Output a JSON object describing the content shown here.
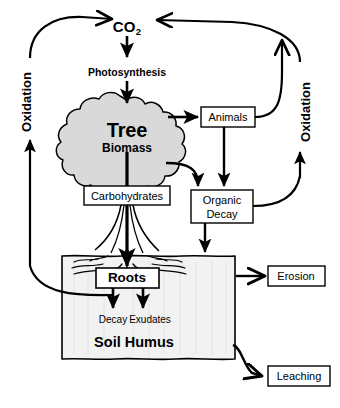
{
  "diagram": {
    "background_color": "#ffffff",
    "line_color": "#000000",
    "canopy_fill": "#d9d9d9",
    "soil_fill": "#f2f2f2",
    "nodes": {
      "co2": {
        "label": "CO",
        "subscript": "2"
      },
      "photosynthesis": {
        "label": "Photosynthesis"
      },
      "tree_biomass": {
        "line1": "Tree",
        "line2": "Biomass"
      },
      "carbohydrates": {
        "label": "Carbohydrates"
      },
      "animals": {
        "label": "Animals"
      },
      "organic_decay": {
        "line1": "Organic",
        "line2": "Decay"
      },
      "roots": {
        "label": "Roots"
      },
      "decay": {
        "label": "Decay"
      },
      "exudates": {
        "label": "Exudates"
      },
      "soil_humus": {
        "label": "Soil Humus"
      },
      "erosion": {
        "label": "Erosion"
      },
      "leaching": {
        "label": "Leaching"
      },
      "oxidation_left": {
        "label": "Oxidation"
      },
      "oxidation_right": {
        "label": "Oxidation"
      }
    }
  }
}
